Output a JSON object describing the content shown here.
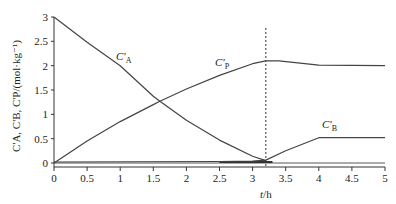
{
  "chart_data": {
    "type": "line",
    "title": "",
    "xlabel": "t/h",
    "ylabel": "C'A, C'B, C'P/(mol·kg⁻¹)",
    "xlim": [
      0,
      5
    ],
    "ylim": [
      0,
      3
    ],
    "grid": false,
    "legend": "inline labels",
    "x_ticks": [
      "0",
      "0.5",
      "1",
      "1.5",
      "2",
      "2.5",
      "3",
      "3.5",
      "4",
      "4.5",
      "5"
    ],
    "y_ticks": [
      "0",
      "0.5",
      "1",
      "1.5",
      "2",
      "2.5",
      "3"
    ],
    "annotations": [
      {
        "type": "vertical-dashed-line",
        "x": 3.2
      }
    ],
    "series": [
      {
        "name": "C'A",
        "x": [
          0,
          0.5,
          1,
          1.5,
          1.6,
          2,
          2.5,
          3,
          3.2
        ],
        "values": [
          3.0,
          2.48,
          2.0,
          1.37,
          1.27,
          0.88,
          0.47,
          0.14,
          0.05
        ]
      },
      {
        "name": "C'P",
        "x": [
          0,
          0.5,
          1,
          1.5,
          1.6,
          2,
          2.5,
          3,
          3.2,
          3.4,
          4,
          5
        ],
        "values": [
          0.0,
          0.45,
          0.85,
          1.2,
          1.27,
          1.52,
          1.8,
          2.04,
          2.1,
          2.1,
          2.01,
          2.0
        ]
      },
      {
        "name": "C'B",
        "x": [
          0,
          2.5,
          3.0,
          3.2,
          3.5,
          4,
          5
        ],
        "values": [
          0.02,
          0.03,
          0.04,
          0.06,
          0.25,
          0.52,
          0.52
        ]
      }
    ]
  }
}
